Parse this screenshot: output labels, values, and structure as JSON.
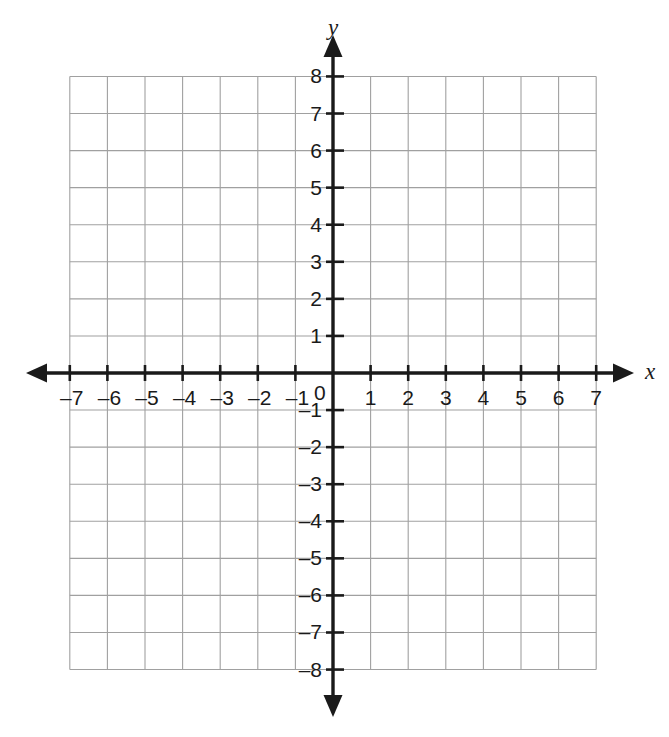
{
  "chart_data": {
    "type": "scatter",
    "title": "",
    "subtitle": "",
    "xlabel": "x",
    "ylabel": "y",
    "xlim": [
      -7,
      7
    ],
    "ylim": [
      -8,
      8
    ],
    "x_tick_step": 1,
    "y_tick_step": 1,
    "grid": true,
    "grid_color": "#a0a0a0",
    "axis_color": "#1a1a1a",
    "background_color": "#ffffff",
    "legend": null,
    "legend_position": "none",
    "series": [],
    "x": [],
    "values": [],
    "annotations": [],
    "origin_label": "0",
    "x_tick_labels": [
      "–7",
      "–6",
      "–5",
      "–4",
      "–3",
      "–2",
      "–1",
      "1",
      "2",
      "3",
      "4",
      "5",
      "6",
      "7"
    ],
    "x_tick_values": [
      -7,
      -6,
      -5,
      -4,
      -3,
      -2,
      -1,
      1,
      2,
      3,
      4,
      5,
      6,
      7
    ],
    "y_tick_labels": [
      "8",
      "7",
      "6",
      "5",
      "4",
      "3",
      "2",
      "1",
      "–1",
      "–2",
      "–3",
      "–4",
      "–5",
      "–6",
      "–7",
      "–8"
    ],
    "y_tick_values": [
      8,
      7,
      6,
      5,
      4,
      3,
      2,
      1,
      -1,
      -2,
      -3,
      -4,
      -5,
      -6,
      -7,
      -8
    ],
    "axis_arrows": [
      "left",
      "right",
      "up",
      "down"
    ]
  },
  "axes": {
    "x_axis_name": "x",
    "y_axis_name": "y"
  }
}
